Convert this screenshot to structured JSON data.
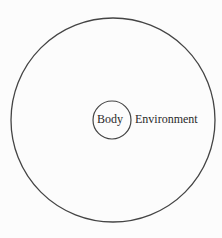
{
  "diagram": {
    "outer_circle": {
      "label": "Environment",
      "cx": 113,
      "cy": 120,
      "r": 102,
      "stroke": "#444444"
    },
    "inner_circle": {
      "label": "Body",
      "cx": 112,
      "cy": 120,
      "r": 19,
      "stroke": "#444444"
    },
    "labels": {
      "body": "Body",
      "environment": "Environment"
    }
  }
}
